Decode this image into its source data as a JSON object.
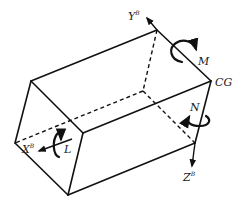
{
  "diagram": {
    "vertices": {
      "top_front_left": [
        31,
        81
      ],
      "top_back_right": [
        157,
        30
      ],
      "cg": [
        211,
        81
      ],
      "front_mid": [
        83,
        133
      ],
      "left": [
        15,
        143
      ],
      "bottom": [
        68,
        195
      ],
      "bottom_right": [
        195,
        143
      ],
      "hidden": [
        143,
        91
      ]
    },
    "solid_edges": [
      [
        "top_front_left",
        "top_back_right"
      ],
      [
        "top_back_right",
        "cg"
      ],
      [
        "top_front_left",
        "front_mid"
      ],
      [
        "front_mid",
        "cg"
      ],
      [
        "top_front_left",
        "left"
      ],
      [
        "left",
        "bottom"
      ],
      [
        "front_mid",
        "bottom"
      ],
      [
        "bottom",
        "bottom_right"
      ],
      [
        "cg",
        "bottom_right"
      ]
    ],
    "dashed_edges": [
      [
        "top_back_right",
        "hidden"
      ],
      [
        "hidden",
        "bottom_right"
      ],
      [
        "hidden",
        "left"
      ]
    ],
    "axes": {
      "y": {
        "label": "Y",
        "superscript": "B"
      },
      "z": {
        "label": "Z",
        "superscript": "B"
      },
      "x": {
        "label": "X",
        "superscript": "B"
      }
    },
    "moments": {
      "roll": "L",
      "pitch": "M",
      "yaw": "N"
    },
    "cg_label": "CG",
    "stroke_color": "#111111"
  }
}
